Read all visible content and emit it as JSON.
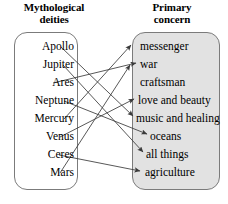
{
  "figure": {
    "type": "bipartite-mapping-diagram",
    "left_header": "Mythological\ndeities",
    "left_header_line1": "Mythological",
    "left_header_line2": "deities",
    "right_header": "Primary\nconcern",
    "right_header_line1": "Primary",
    "right_header_line2": "concern",
    "left_box_fill": "#ffffff",
    "right_box_fill": "#e2e2e2",
    "border_color": "#7b7b7b",
    "arrow_color": "#3a3a3a"
  },
  "domain": {
    "name": "Mythological deities",
    "items": [
      {
        "label": "Apollo",
        "x": 74,
        "y": 47
      },
      {
        "label": "Jupiter",
        "x": 74,
        "y": 65
      },
      {
        "label": "Ares",
        "x": 74,
        "y": 83
      },
      {
        "label": "Neptune",
        "x": 74,
        "y": 101
      },
      {
        "label": "Mercury",
        "x": 74,
        "y": 119
      },
      {
        "label": "Venus",
        "x": 74,
        "y": 137
      },
      {
        "label": "Ceres",
        "x": 74,
        "y": 155
      },
      {
        "label": "Mars",
        "x": 74,
        "y": 173
      }
    ]
  },
  "codomain": {
    "name": "Primary concern",
    "items": [
      {
        "label": "messenger",
        "x": 140,
        "y": 47
      },
      {
        "label": "war",
        "x": 140,
        "y": 65
      },
      {
        "label": "craftsman",
        "x": 140,
        "y": 83
      },
      {
        "label": "love and beauty",
        "x": 138,
        "y": 101
      },
      {
        "label": "music and healing",
        "x": 136,
        "y": 119
      },
      {
        "label": "oceans",
        "x": 150,
        "y": 137
      },
      {
        "label": "all things",
        "x": 146,
        "y": 155
      },
      {
        "label": "agriculture",
        "x": 145,
        "y": 173
      }
    ]
  },
  "mappings": [
    {
      "from": "Apollo",
      "to": "music and healing",
      "x1": 61,
      "y1": 47,
      "x2": 133,
      "y2": 116
    },
    {
      "from": "Jupiter",
      "to": "all things",
      "x1": 63,
      "y1": 65,
      "x2": 143,
      "y2": 152
    },
    {
      "from": "Ares",
      "to": "war",
      "x1": 53,
      "y1": 83,
      "x2": 136,
      "y2": 63
    },
    {
      "from": "Neptune",
      "to": "oceans",
      "x1": 64,
      "y1": 101,
      "x2": 147,
      "y2": 134
    },
    {
      "from": "Mercury",
      "to": "messenger",
      "x1": 64,
      "y1": 119,
      "x2": 131,
      "y2": 45
    },
    {
      "from": "Venus",
      "to": "love and beauty",
      "x1": 60,
      "y1": 137,
      "x2": 134,
      "y2": 99
    },
    {
      "from": "Ceres",
      "to": "agriculture",
      "x1": 59,
      "y1": 155,
      "x2": 140,
      "y2": 171
    },
    {
      "from": "Mars",
      "to": "war",
      "x1": 60,
      "y1": 173,
      "x2": 130,
      "y2": 65
    }
  ]
}
